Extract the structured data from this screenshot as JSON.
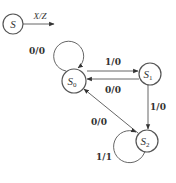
{
  "diagram": {
    "type": "state-diagram",
    "legend": {
      "state_symbol": "S",
      "transition_label": "X/Z"
    },
    "states": [
      {
        "id": "S0",
        "label": "S",
        "subscript": "0"
      },
      {
        "id": "S1",
        "label": "S",
        "subscript": "1"
      },
      {
        "id": "S2",
        "label": "S",
        "subscript": "2"
      }
    ],
    "transitions": [
      {
        "from": "S0",
        "to": "S0",
        "label": "0/0"
      },
      {
        "from": "S0",
        "to": "S1",
        "label": "1/0"
      },
      {
        "from": "S1",
        "to": "S0",
        "label": "0/0"
      },
      {
        "from": "S1",
        "to": "S2",
        "label": "1/0"
      },
      {
        "from": "S2",
        "to": "S0",
        "label": "0/0"
      },
      {
        "from": "S2",
        "to": "S2",
        "label": "1/1"
      }
    ],
    "colors": {
      "stroke": "#555555",
      "text": "#333333",
      "background": "#ffffff"
    }
  }
}
